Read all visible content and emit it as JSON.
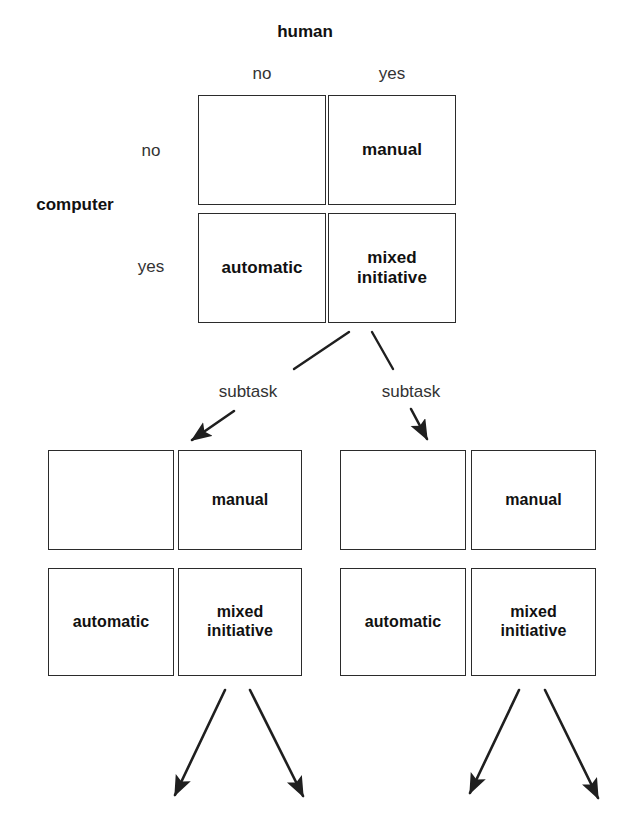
{
  "diagram": {
    "title_axis_top": "human",
    "title_axis_left": "computer",
    "column_labels": [
      "no",
      "yes"
    ],
    "row_labels": [
      "no",
      "yes"
    ],
    "edge_labels": [
      "subtask",
      "subtask"
    ],
    "colors": {
      "stroke": "#2b2b2b",
      "text": "#111111",
      "tick_text": "#333333",
      "background": "#ffffff"
    },
    "matrices": [
      {
        "id": "root-matrix",
        "cells": [
          {
            "id": "root-no-no",
            "row": "no",
            "col": "no",
            "label": "",
            "mark": "cross"
          },
          {
            "id": "root-no-yes",
            "row": "no",
            "col": "yes",
            "label": "manual",
            "mark": "text"
          },
          {
            "id": "root-yes-no",
            "row": "yes",
            "col": "no",
            "label": "automatic",
            "mark": "text"
          },
          {
            "id": "root-yes-yes",
            "row": "yes",
            "col": "yes",
            "label": "mixed\ninitiative",
            "mark": "text"
          }
        ]
      },
      {
        "id": "left-subtask-matrix",
        "cells": [
          {
            "id": "left-no-no",
            "row": "no",
            "col": "no",
            "label": "",
            "mark": "cross"
          },
          {
            "id": "left-no-yes",
            "row": "no",
            "col": "yes",
            "label": "manual",
            "mark": "text"
          },
          {
            "id": "left-yes-no",
            "row": "yes",
            "col": "no",
            "label": "automatic",
            "mark": "text"
          },
          {
            "id": "left-yes-yes",
            "row": "yes",
            "col": "yes",
            "label": "mixed\ninitiative",
            "mark": "text"
          }
        ]
      },
      {
        "id": "right-subtask-matrix",
        "cells": [
          {
            "id": "right-no-no",
            "row": "no",
            "col": "no",
            "label": "",
            "mark": "cross"
          },
          {
            "id": "right-no-yes",
            "row": "no",
            "col": "yes",
            "label": "manual",
            "mark": "text"
          },
          {
            "id": "right-yes-no",
            "row": "yes",
            "col": "no",
            "label": "automatic",
            "mark": "text"
          },
          {
            "id": "right-yes-yes",
            "row": "yes",
            "col": "yes",
            "label": "mixed\ninitiative",
            "mark": "text"
          }
        ]
      }
    ]
  }
}
